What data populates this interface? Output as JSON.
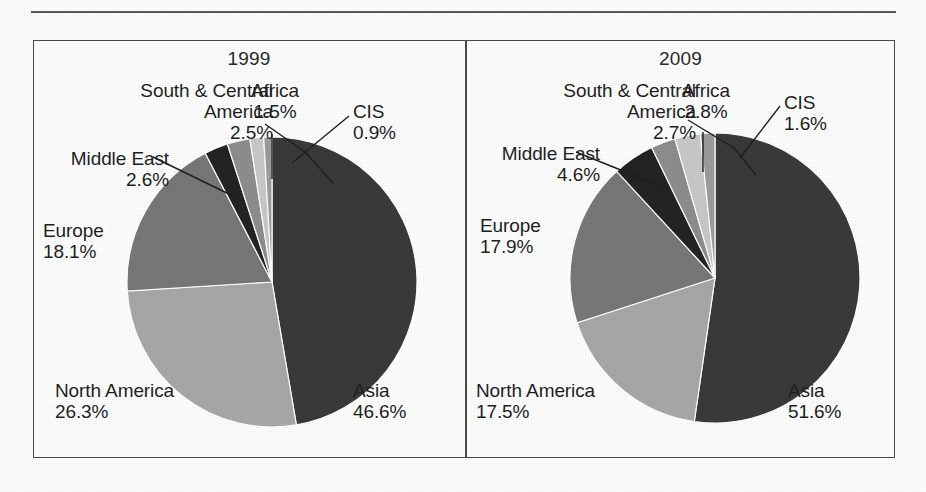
{
  "figure": {
    "panels": [
      {
        "title": "1999",
        "center": [
          239,
          242
        ],
        "radius": 145,
        "slices": [
          {
            "label": "Asia",
            "value": 46.6,
            "percent_text": "46.6%",
            "color": "#3a3a3a"
          },
          {
            "label": "North America",
            "value": 26.3,
            "percent_text": "26.3%",
            "color": "#a8a8a8"
          },
          {
            "label": "Europe",
            "value": 18.1,
            "percent_text": "18.1%",
            "color": "#787878"
          },
          {
            "label": "Middle East",
            "value": 2.6,
            "percent_text": "2.6%",
            "color": "#242424"
          },
          {
            "label": "South & Central\nAmerica",
            "value": 2.5,
            "percent_text": "2.5%",
            "color": "#8e8e8e"
          },
          {
            "label": "Africa",
            "value": 1.5,
            "percent_text": "1.5%",
            "color": "#c9c9c9"
          },
          {
            "label": "CIS",
            "value": 0.9,
            "percent_text": "0.9%",
            "color": "#9c9c9c"
          }
        ],
        "labels": [
          {
            "name": "south-central-america",
            "text": "South & Central\nAmerica\n2.5%",
            "x": 20,
            "y": 40,
            "w": 220,
            "align": "r"
          },
          {
            "name": "africa",
            "text": "Africa\n1.5%",
            "x": 196,
            "y": 40,
            "w": 92,
            "align": "c"
          },
          {
            "name": "cis",
            "text": "CIS\n0.9%",
            "x": 320,
            "y": 61,
            "w": 80,
            "align": "l"
          },
          {
            "name": "middle-east",
            "text": "Middle East\n2.6%",
            "x": 0,
            "y": 108,
            "w": 136,
            "align": "r"
          },
          {
            "name": "europe",
            "text": "Europe\n18.1%",
            "x": 10,
            "y": 180,
            "w": 92,
            "align": "l"
          },
          {
            "name": "north-america",
            "text": "North America\n26.3%",
            "x": 22,
            "y": 340,
            "w": 160,
            "align": "l"
          },
          {
            "name": "asia",
            "text": "Asia\n46.6%",
            "x": 320,
            "y": 340,
            "w": 88,
            "align": "l"
          }
        ],
        "leaders": [
          {
            "name": "leader-south-central-america",
            "points": "232,84 272,112 301,144"
          },
          {
            "name": "leader-africa",
            "points": "239,94 239,139"
          },
          {
            "name": "leader-cis",
            "points": "316,76 259,123"
          },
          {
            "name": "leader-middle-east",
            "points": "120,117 204,158"
          }
        ]
      },
      {
        "title": "2009",
        "center": [
          249,
          238
        ],
        "radius": 145,
        "slices": [
          {
            "label": "Asia",
            "value": 51.6,
            "percent_text": "51.6%",
            "color": "#3a3a3a"
          },
          {
            "label": "North America",
            "value": 17.5,
            "percent_text": "17.5%",
            "color": "#a8a8a8"
          },
          {
            "label": "Europe",
            "value": 17.9,
            "percent_text": "17.9%",
            "color": "#787878"
          },
          {
            "label": "Middle East",
            "value": 4.6,
            "percent_text": "4.6%",
            "color": "#242424"
          },
          {
            "label": "South & Central\nAmerica",
            "value": 2.7,
            "percent_text": "2.7%",
            "color": "#8e8e8e"
          },
          {
            "label": "Africa",
            "value": 2.8,
            "percent_text": "2.8%",
            "color": "#c9c9c9"
          },
          {
            "label": "CIS",
            "value": 1.6,
            "percent_text": "1.6%",
            "color": "#9c9c9c"
          }
        ],
        "labels": [
          {
            "name": "south-central-america",
            "text": "South & Central\nAmerica\n2.7%",
            "x": 8,
            "y": 40,
            "w": 222,
            "align": "r"
          },
          {
            "name": "africa",
            "text": "Africa\n2.8%",
            "x": 194,
            "y": 40,
            "w": 92,
            "align": "c"
          },
          {
            "name": "cis",
            "text": "CIS\n1.6%",
            "x": 318,
            "y": 52,
            "w": 80,
            "align": "l"
          },
          {
            "name": "middle-east",
            "text": "Middle East\n4.6%",
            "x": 0,
            "y": 103,
            "w": 134,
            "align": "r"
          },
          {
            "name": "europe",
            "text": "Europe\n17.9%",
            "x": 14,
            "y": 175,
            "w": 92,
            "align": "l"
          },
          {
            "name": "north-america",
            "text": "North America\n17.5%",
            "x": 10,
            "y": 340,
            "w": 160,
            "align": "l"
          },
          {
            "name": "asia",
            "text": "Asia\n51.6%",
            "x": 322,
            "y": 340,
            "w": 88,
            "align": "l"
          }
        ],
        "leaders": [
          {
            "name": "leader-south-central-america",
            "points": "222,80 268,108 290,135"
          },
          {
            "name": "leader-africa",
            "points": "237,92 237,132"
          },
          {
            "name": "leader-cis",
            "points": "314,66 274,118"
          },
          {
            "name": "leader-middle-east",
            "points": "110,112 192,145"
          }
        ]
      }
    ]
  },
  "colors": {
    "border": "#4a4a4a",
    "rule": "#595959",
    "text": "#1f1f1f",
    "background": "#ffffff"
  },
  "chart_data": [
    {
      "type": "pie",
      "title": "1999",
      "categories": [
        "Asia",
        "North America",
        "Europe",
        "Middle East",
        "South & Central America",
        "Africa",
        "CIS"
      ],
      "values": [
        46.6,
        26.3,
        18.1,
        2.6,
        2.5,
        1.5,
        0.9
      ],
      "unit": "percent",
      "labels": [
        "46.6%",
        "26.3%",
        "18.1%",
        "2.6%",
        "2.5%",
        "1.5%",
        "0.9%"
      ],
      "colors": [
        "#3a3a3a",
        "#a8a8a8",
        "#787878",
        "#242424",
        "#8e8e8e",
        "#c9c9c9",
        "#9c9c9c"
      ],
      "start_angle_deg": 0,
      "direction": "clockwise",
      "legend": "callout-labels",
      "grid": false
    },
    {
      "type": "pie",
      "title": "2009",
      "categories": [
        "Asia",
        "North America",
        "Europe",
        "Middle East",
        "South & Central America",
        "Africa",
        "CIS"
      ],
      "values": [
        51.6,
        17.5,
        17.9,
        4.6,
        2.7,
        2.8,
        1.6
      ],
      "unit": "percent",
      "labels": [
        "51.6%",
        "17.5%",
        "17.9%",
        "4.6%",
        "2.7%",
        "2.8%",
        "1.6%"
      ],
      "colors": [
        "#3a3a3a",
        "#a8a8a8",
        "#787878",
        "#242424",
        "#8e8e8e",
        "#c9c9c9",
        "#9c9c9c"
      ],
      "start_angle_deg": 0,
      "direction": "clockwise",
      "legend": "callout-labels",
      "grid": false
    }
  ]
}
